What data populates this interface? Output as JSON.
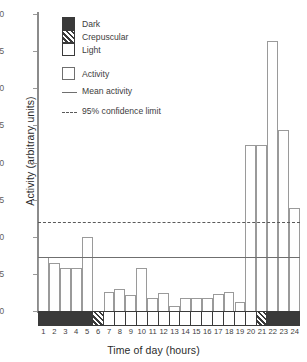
{
  "chart_data": {
    "type": "bar",
    "title": "",
    "xlabel": "Time of day (hours)",
    "ylabel": "Activity (arbitrary units)",
    "categories": [
      "1",
      "2",
      "3",
      "4",
      "5",
      "6",
      "7",
      "8",
      "9",
      "10",
      "11",
      "12",
      "13",
      "14",
      "15",
      "16",
      "17",
      "18",
      "19",
      "20",
      "21",
      "22",
      "23",
      "24"
    ],
    "values": [
      7.3,
      6.4,
      5.8,
      5.8,
      10.0,
      0.0,
      2.6,
      3.0,
      2.2,
      5.8,
      1.8,
      2.4,
      0.7,
      1.8,
      1.8,
      1.8,
      2.3,
      2.6,
      1.2,
      22.3,
      22.3,
      36.3,
      24.4,
      13.9
    ],
    "ylim": [
      0,
      40
    ],
    "yticks": [
      0,
      5,
      10,
      15,
      20,
      25,
      30,
      35,
      40
    ],
    "grid": false,
    "legend_position": "upper-left",
    "mean_activity": 7.3,
    "confidence_limit_95": 12.0,
    "light_cycle": [
      "dark",
      "dark",
      "dark",
      "dark",
      "dark",
      "crepuscular",
      "light",
      "light",
      "light",
      "light",
      "light",
      "light",
      "light",
      "light",
      "light",
      "light",
      "light",
      "light",
      "light",
      "light",
      "crepuscular",
      "dark",
      "dark",
      "dark"
    ],
    "annotations": []
  },
  "legend": {
    "cycle_items": [
      {
        "label": "Dark",
        "swatch": "dark"
      },
      {
        "label": "Crepuscular",
        "swatch": "crepuscular"
      },
      {
        "label": "Light",
        "swatch": "light"
      }
    ],
    "series_items": [
      {
        "label": "Activity",
        "swatch": "bar-outline"
      },
      {
        "label": "Mean activity",
        "swatch": "solid-line"
      },
      {
        "label": "95% confidence limit",
        "swatch": "dashed-line"
      }
    ]
  },
  "colors": {
    "dark": "#3a3a3a",
    "light": "#ffffff",
    "axis": "#8b8b8b",
    "bar_outline": "#9a9a9a",
    "mean_line": "#6f6f6f",
    "confidence_line": "#5a5a5a"
  }
}
